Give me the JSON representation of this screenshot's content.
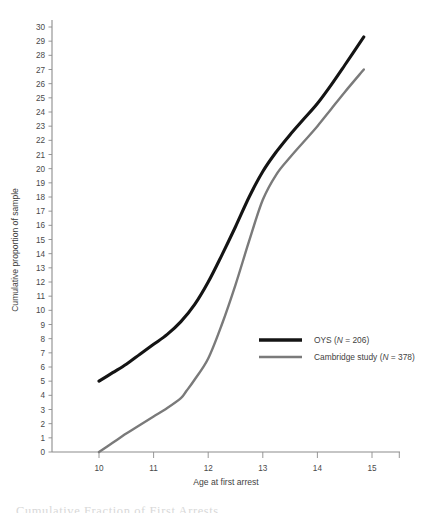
{
  "figure": {
    "caption_partial": "Cumulative Fraction of First Arrests"
  },
  "axes": {
    "x_title": "Age at first arrest",
    "y_title": "Cumulative proportion of sample",
    "x_ticks": [
      "10",
      "11",
      "12",
      "13",
      "14",
      "15"
    ],
    "y_ticks": [
      "0",
      "1",
      "2",
      "3",
      "4",
      "5",
      "6",
      "7",
      "8",
      "9",
      "10",
      "11",
      "12",
      "13",
      "14",
      "15",
      "16",
      "17",
      "18",
      "19",
      "20",
      "21",
      "22",
      "23",
      "24",
      "25",
      "26",
      "27",
      "28",
      "29",
      "30"
    ]
  },
  "legend": {
    "items": [
      {
        "name_main": "OYS",
        "n_prefix": " (",
        "n_italic": "N",
        "n_value": " = 206)",
        "color": "#141414",
        "width": 3.6
      },
      {
        "name_main": "Cambridge study",
        "n_prefix": " (",
        "n_italic": "N",
        "n_value": " = 378)",
        "color": "#7a7a7a",
        "width": 2.6
      }
    ]
  },
  "colors": {
    "oys_line": "#141414",
    "cambridge_line": "#7a7a7a",
    "axis": "#8c8c8c",
    "text": "#3f3f3f",
    "background": "#ffffff"
  },
  "chart_data": {
    "type": "line",
    "title": "",
    "xlabel": "Age at first arrest",
    "ylabel": "Cumulative proportion of sample",
    "xlim": [
      9.4,
      15.4
    ],
    "ylim": [
      0,
      30
    ],
    "grid": false,
    "legend_position": "center-right",
    "x_tick_values": [
      10,
      11,
      12,
      13,
      14,
      15
    ],
    "y_tick_values": [
      0,
      1,
      2,
      3,
      4,
      5,
      6,
      7,
      8,
      9,
      10,
      11,
      12,
      13,
      14,
      15,
      16,
      17,
      18,
      19,
      20,
      21,
      22,
      23,
      24,
      25,
      26,
      27,
      28,
      29,
      30
    ],
    "series": [
      {
        "name": "OYS (N = 206)",
        "color": "#141414",
        "x": [
          10.0,
          10.25,
          10.5,
          10.75,
          11.0,
          11.25,
          11.5,
          11.75,
          12.0,
          12.25,
          12.5,
          12.75,
          13.0,
          13.25,
          13.5,
          13.75,
          14.0,
          14.25,
          14.5,
          14.85
        ],
        "y": [
          5.0,
          5.6,
          6.2,
          6.9,
          7.6,
          8.3,
          9.2,
          10.4,
          12.0,
          13.9,
          15.9,
          18.0,
          19.8,
          21.2,
          22.4,
          23.5,
          24.6,
          25.9,
          27.3,
          29.3
        ]
      },
      {
        "name": "Cambridge study (N = 378)",
        "color": "#7a7a7a",
        "x": [
          10.0,
          10.25,
          10.5,
          10.75,
          11.0,
          11.25,
          11.5,
          11.6,
          11.75,
          12.0,
          12.25,
          12.5,
          12.75,
          13.0,
          13.25,
          13.5,
          13.75,
          14.0,
          14.25,
          14.5,
          14.85
        ],
        "y": [
          0.0,
          0.65,
          1.3,
          1.9,
          2.5,
          3.1,
          3.8,
          4.3,
          5.1,
          6.6,
          9.0,
          11.8,
          14.9,
          17.8,
          19.6,
          20.8,
          21.9,
          23.0,
          24.2,
          25.4,
          27.0
        ]
      }
    ]
  }
}
